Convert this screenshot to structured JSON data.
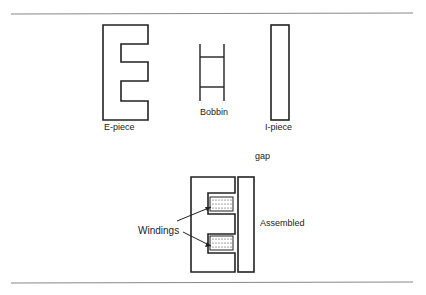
{
  "figure": {
    "labels": {
      "e_piece": "E-piece",
      "bobbin": "Bobbin",
      "i_piece": "I-piece",
      "gap": "gap",
      "windings": "Windings",
      "assembled": "Assembled"
    },
    "colors": {
      "line": "#222222",
      "rule": "#888888",
      "background": "#ffffff"
    }
  }
}
